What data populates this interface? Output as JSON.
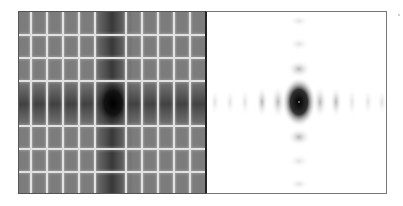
{
  "figure": {
    "panels": [
      {
        "id": "left",
        "label": "Log-magnitude spectrum",
        "description": "Grayscale pattern with bright white grid lines and dark central cross/blob",
        "background_gray": "#7a7a7a",
        "center_color": "#000000",
        "grid_line_color": "#f4f4f4",
        "vertical_lines_x": [
          12,
          28,
          44,
          60,
          76,
          107,
          123,
          139,
          155,
          171
        ],
        "horizontal_lines_y": [
          23,
          46,
          69,
          114,
          137,
          160
        ],
        "center": [
          94,
          91
        ]
      },
      {
        "id": "right",
        "label": "Magnitude spectrum",
        "description": "White background with dark central blob and faint side lobes along horizontal and vertical axes",
        "background": "#ffffff",
        "center_color": "#111111",
        "center": [
          92,
          90
        ],
        "horizontal_lobes_x": [
          8,
          23,
          38,
          55,
          71,
          113,
          129,
          145,
          161,
          175
        ],
        "vertical_lobes_y": [
          9,
          32,
          57,
          125,
          149,
          172
        ]
      }
    ]
  }
}
